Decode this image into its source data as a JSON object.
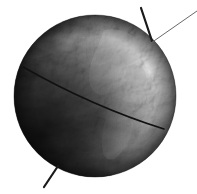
{
  "figure": {
    "kind": "shaded-relief-earth-globe-diagram",
    "title": "Earth globe with rotation axis and equator line",
    "canvas": {
      "width": 197,
      "height": 194,
      "background": "#ffffff"
    }
  },
  "globe": {
    "name": "earth-globe",
    "center_x": 95,
    "center_y": 96,
    "radius": 81,
    "description": "Grayscale shaded relief Earth showing the Americas, with a day-night terminator",
    "colors": {
      "night_deep": "#141414",
      "night": "#242424",
      "twilight": "#454545",
      "day_mid": "#8a8a8a",
      "day_bright": "#c4c4c4",
      "highlight": "#dcdcdc",
      "limb_shadow": "#0e0e0e"
    },
    "lighting": {
      "sun_direction": "upper-right",
      "terminator_note": "bright limb on right, deep shadow on lower-left"
    }
  },
  "equator_line": {
    "name": "equator-great-circle",
    "label": "equator",
    "color": "#111111",
    "stroke_width": 1.6,
    "start_x": 23,
    "start_y": 67,
    "end_x": 164,
    "end_y": 129,
    "sag": 9
  },
  "axis": {
    "name": "rotation-axis",
    "label": "rotation axis",
    "color": "#1a1a1a",
    "stroke_width": 2.2,
    "north_segment": {
      "x1": 141,
      "y1": 8,
      "x2": 152,
      "y2": 41
    },
    "south_segment": {
      "x1": 58,
      "y1": 166,
      "x2": 44,
      "y2": 187
    }
  },
  "pointer_line": {
    "name": "annotation-pointer-line",
    "label": "pointer",
    "color": "#6a6a6a",
    "stroke_width": 1.0,
    "x1": 197,
    "y1": 11,
    "x2": 151,
    "y2": 43
  },
  "continents": [
    {
      "name": "north-america-landmass",
      "tone": "#9a9a9a"
    },
    {
      "name": "south-america-landmass",
      "tone": "#7e7e7e"
    },
    {
      "name": "cloud-band",
      "tone": "#cfcfcf"
    }
  ]
}
